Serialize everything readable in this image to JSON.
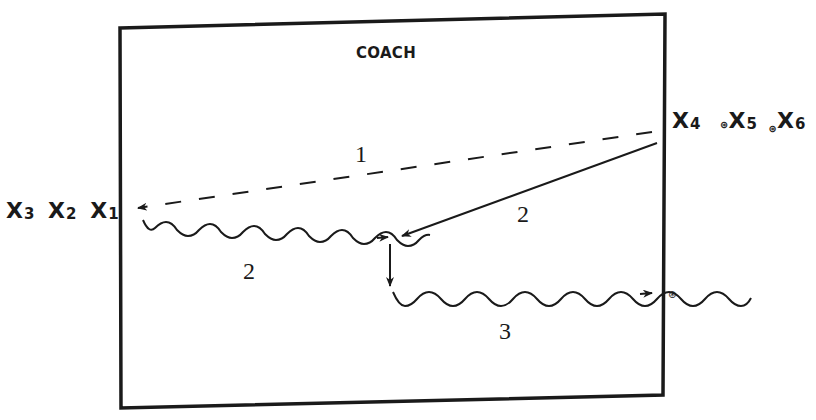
{
  "diagram": {
    "title_clipped": "",
    "coach_label": "COACH",
    "players_left": [
      {
        "name": "X",
        "sub": "3"
      },
      {
        "name": "X",
        "sub": "2"
      },
      {
        "name": "X",
        "sub": "1"
      }
    ],
    "players_right": [
      {
        "name": "X",
        "sub": "4"
      },
      {
        "name": "X",
        "sub": "5"
      },
      {
        "name": "X",
        "sub": "6"
      }
    ],
    "ball_symbol": "⊛",
    "step_labels": {
      "pass_1": "1",
      "dribble_2": "2",
      "pass_2": "2",
      "dribble_3": "3"
    },
    "colors": {
      "ink": "#1a1a1a",
      "background": "#ffffff"
    },
    "moves": [
      {
        "step": "1",
        "type": "pass",
        "style": "dashed",
        "from": "X4",
        "to": "X1"
      },
      {
        "step": "2",
        "type": "dribble",
        "style": "wavy",
        "from": "X1",
        "to": "center"
      },
      {
        "step": "2",
        "type": "run",
        "style": "solid",
        "from": "X4",
        "to": "center"
      },
      {
        "step": "3",
        "type": "dribble",
        "style": "wavy",
        "from": "center",
        "to": "right-end-ball"
      }
    ]
  }
}
